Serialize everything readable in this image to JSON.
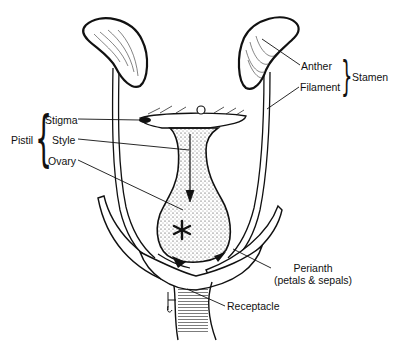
{
  "diagram": {
    "type": "labeled botanical illustration",
    "colors": {
      "ink": "#111111",
      "background": "#ffffff"
    },
    "groups": [
      {
        "name": "Pistil",
        "members": [
          "Stigma",
          "Style",
          "Ovary"
        ]
      },
      {
        "name": "Stamen",
        "members": [
          "Anther",
          "Filament"
        ]
      }
    ],
    "labels": {
      "stigma": "Stigma",
      "style": "Style",
      "ovary": "Ovary",
      "pistil": "Pistil",
      "anther": "Anther",
      "filament": "Filament",
      "stamen": "Stamen",
      "perianth": "Perianth",
      "perianth_note": "(petals & sepals)",
      "receptacle": "Receptacle"
    },
    "marker": "*"
  }
}
